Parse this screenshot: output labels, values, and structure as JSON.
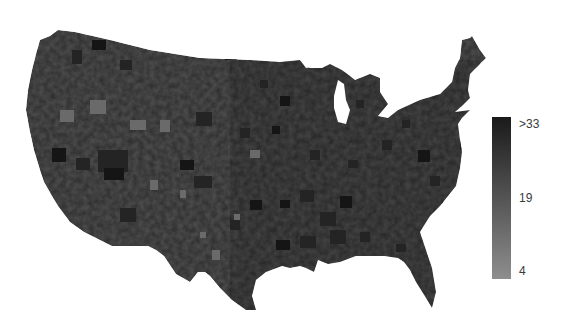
{
  "map": {
    "region": "Contiguous United States",
    "level": "county",
    "style": "grayscale choropleth",
    "base_color": "#4a4a4a",
    "outline": [
      [
        40,
        40
      ],
      [
        50,
        36
      ],
      [
        58,
        30
      ],
      [
        75,
        32
      ],
      [
        110,
        40
      ],
      [
        150,
        50
      ],
      [
        200,
        58
      ],
      [
        250,
        60
      ],
      [
        280,
        62
      ],
      [
        300,
        60
      ],
      [
        310,
        68
      ],
      [
        322,
        68
      ],
      [
        330,
        64
      ],
      [
        342,
        70
      ],
      [
        350,
        76
      ],
      [
        355,
        80
      ],
      [
        370,
        74
      ],
      [
        380,
        78
      ],
      [
        380,
        92
      ],
      [
        388,
        104
      ],
      [
        378,
        116
      ],
      [
        388,
        118
      ],
      [
        398,
        110
      ],
      [
        420,
        100
      ],
      [
        440,
        94
      ],
      [
        452,
        82
      ],
      [
        455,
        68
      ],
      [
        460,
        58
      ],
      [
        462,
        40
      ],
      [
        470,
        38
      ],
      [
        472,
        36
      ],
      [
        480,
        50
      ],
      [
        486,
        58
      ],
      [
        478,
        66
      ],
      [
        470,
        74
      ],
      [
        468,
        90
      ],
      [
        470,
        98
      ],
      [
        462,
        106
      ],
      [
        455,
        112
      ],
      [
        470,
        110
      ],
      [
        462,
        118
      ],
      [
        458,
        124
      ],
      [
        460,
        140
      ],
      [
        462,
        152
      ],
      [
        460,
        168
      ],
      [
        456,
        186
      ],
      [
        448,
        196
      ],
      [
        440,
        206
      ],
      [
        430,
        216
      ],
      [
        420,
        232
      ],
      [
        426,
        250
      ],
      [
        432,
        268
      ],
      [
        436,
        292
      ],
      [
        432,
        308
      ],
      [
        426,
        298
      ],
      [
        416,
        282
      ],
      [
        410,
        270
      ],
      [
        404,
        262
      ],
      [
        398,
        258
      ],
      [
        384,
        256
      ],
      [
        372,
        256
      ],
      [
        356,
        256
      ],
      [
        340,
        262
      ],
      [
        328,
        264
      ],
      [
        318,
        260
      ],
      [
        314,
        272
      ],
      [
        306,
        268
      ],
      [
        300,
        266
      ],
      [
        290,
        268
      ],
      [
        282,
        266
      ],
      [
        266,
        272
      ],
      [
        256,
        280
      ],
      [
        252,
        296
      ],
      [
        256,
        310
      ],
      [
        246,
        310
      ],
      [
        232,
        300
      ],
      [
        220,
        288
      ],
      [
        210,
        276
      ],
      [
        205,
        272
      ],
      [
        198,
        272
      ],
      [
        190,
        282
      ],
      [
        176,
        274
      ],
      [
        164,
        256
      ],
      [
        156,
        250
      ],
      [
        148,
        246
      ],
      [
        130,
        246
      ],
      [
        112,
        246
      ],
      [
        100,
        240
      ],
      [
        84,
        232
      ],
      [
        70,
        222
      ],
      [
        58,
        206
      ],
      [
        52,
        196
      ],
      [
        44,
        182
      ],
      [
        40,
        170
      ],
      [
        34,
        150
      ],
      [
        30,
        132
      ],
      [
        26,
        110
      ],
      [
        28,
        90
      ],
      [
        32,
        70
      ],
      [
        36,
        54
      ]
    ],
    "lakes": [
      {
        "name": "Lake Michigan",
        "points": [
          [
            338,
            80
          ],
          [
            344,
            84
          ],
          [
            346,
            100
          ],
          [
            350,
            110
          ],
          [
            346,
            124
          ],
          [
            338,
            122
          ],
          [
            334,
            108
          ],
          [
            334,
            96
          ]
        ]
      },
      {
        "name": "Lake Superior",
        "points": [
          [
            300,
            60
          ],
          [
            318,
            56
          ],
          [
            330,
            58
          ],
          [
            322,
            66
          ],
          [
            306,
            68
          ]
        ]
      }
    ],
    "dark_patches": [
      [
        92,
        40,
        14,
        10
      ],
      [
        72,
        50,
        10,
        14
      ],
      [
        120,
        60,
        12,
        10
      ],
      [
        225,
        48,
        12,
        12
      ],
      [
        310,
        60,
        8,
        8
      ],
      [
        196,
        112,
        16,
        14
      ],
      [
        52,
        148,
        14,
        14
      ],
      [
        76,
        158,
        14,
        12
      ],
      [
        98,
        150,
        30,
        22
      ],
      [
        104,
        168,
        20,
        12
      ],
      [
        120,
        208,
        16,
        14
      ],
      [
        194,
        176,
        18,
        12
      ],
      [
        180,
        160,
        14,
        10
      ],
      [
        300,
        190,
        14,
        12
      ],
      [
        320,
        212,
        16,
        14
      ],
      [
        340,
        196,
        12,
        12
      ],
      [
        330,
        230,
        16,
        14
      ],
      [
        300,
        236,
        16,
        12
      ],
      [
        276,
        240,
        14,
        10
      ],
      [
        310,
        150,
        10,
        10
      ],
      [
        382,
        140,
        10,
        10
      ],
      [
        418,
        150,
        12,
        12
      ],
      [
        430,
        176,
        10,
        10
      ],
      [
        230,
        220,
        10,
        10
      ],
      [
        250,
        200,
        12,
        10
      ],
      [
        360,
        232,
        10,
        10
      ],
      [
        396,
        244,
        10,
        8
      ],
      [
        280,
        200,
        10,
        8
      ],
      [
        348,
        160,
        10,
        8
      ],
      [
        240,
        128,
        10,
        10
      ],
      [
        272,
        126,
        8,
        8
      ],
      [
        402,
        120,
        8,
        8
      ],
      [
        356,
        100,
        8,
        8
      ],
      [
        280,
        96,
        10,
        10
      ],
      [
        260,
        80,
        8,
        8
      ],
      [
        460,
        140,
        6,
        10
      ],
      [
        442,
        202,
        8,
        8
      ]
    ],
    "light_patches": [
      [
        150,
        180,
        8,
        10
      ],
      [
        180,
        190,
        6,
        8
      ],
      [
        212,
        250,
        8,
        10
      ],
      [
        200,
        232,
        6,
        6
      ],
      [
        234,
        214,
        6,
        6
      ],
      [
        160,
        120,
        10,
        12
      ],
      [
        60,
        110,
        14,
        12
      ],
      [
        90,
        100,
        16,
        14
      ],
      [
        250,
        150,
        10,
        8
      ],
      [
        130,
        120,
        16,
        10
      ]
    ]
  },
  "legend": {
    "orientation": "vertical",
    "color_top": "#1a1a1a",
    "color_bottom": "#8e8e8e",
    "labels": {
      "top": ">33",
      "middle": "19",
      "bottom": "4"
    }
  }
}
